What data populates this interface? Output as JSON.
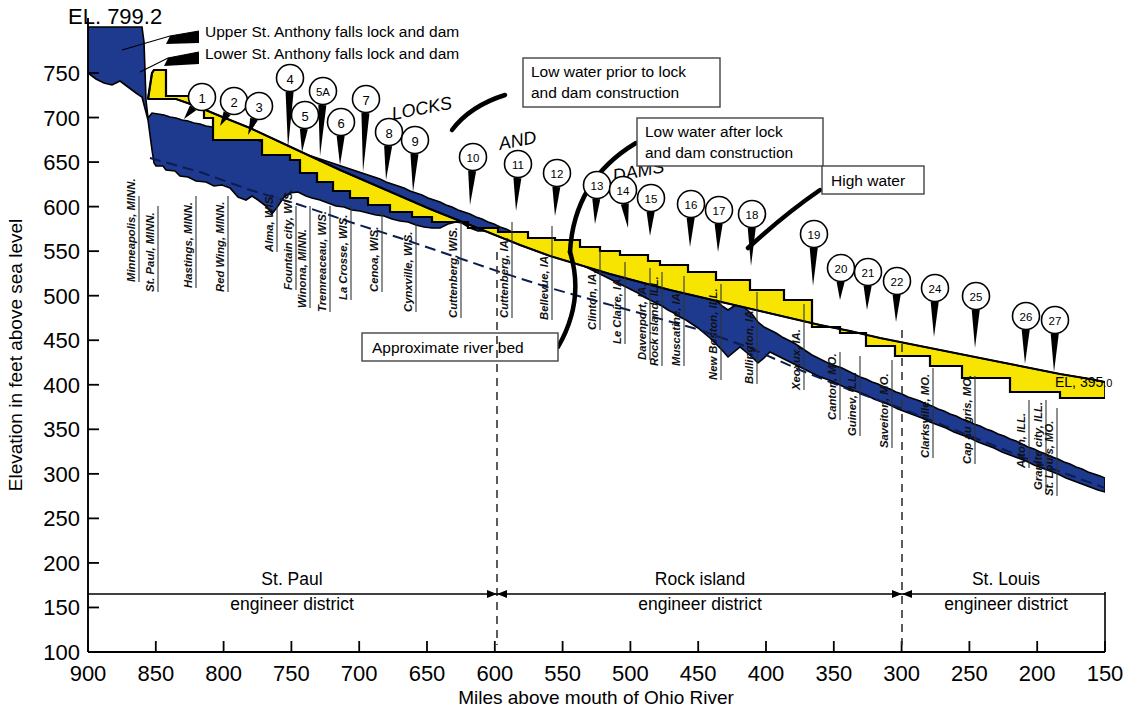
{
  "chart_data": {
    "type": "area",
    "xlabel": "Miles above mouth of Ohio River",
    "ylabel": "Elevation in feet above sea level",
    "xlim": [
      900,
      150
    ],
    "ylim": [
      100,
      780
    ],
    "x_ticks": [
      900,
      850,
      800,
      750,
      700,
      650,
      600,
      550,
      500,
      450,
      400,
      350,
      300,
      250,
      200,
      150
    ],
    "y_ticks": [
      100,
      150,
      200,
      250,
      300,
      350,
      400,
      450,
      500,
      550,
      600,
      650,
      700,
      750
    ],
    "grid": false,
    "legend_position": "annotations",
    "annotations": {
      "top_elevation": "EL. 799.2",
      "bottom_elevation_prefix": "EL,",
      "bottom_elevation_value": "395",
      "bottom_elevation_decimal": ".0"
    },
    "series": [
      {
        "name": "Low water prior to lock and dam construction",
        "note": "upper black boundary of yellow band"
      },
      {
        "name": "Low water after lock and dam construction",
        "note": "stepped pool profile, top of blue steps"
      },
      {
        "name": "High water",
        "note": "upper blue envelope"
      },
      {
        "name": "Approximate river bed",
        "note": "dashed line through blue band"
      }
    ],
    "pool_steps_miles_elev": [
      [
        900,
        799.2
      ],
      [
        858,
        750
      ],
      [
        854,
        725
      ],
      [
        847,
        725
      ],
      [
        840,
        700
      ],
      [
        820,
        700
      ],
      [
        810,
        686
      ],
      [
        775,
        686
      ],
      [
        770,
        675
      ],
      [
        745,
        675
      ],
      [
        735,
        667
      ],
      [
        712,
        667
      ],
      [
        705,
        660
      ],
      [
        690,
        660
      ],
      [
        683,
        651
      ],
      [
        660,
        651
      ],
      [
        652,
        645
      ],
      [
        630,
        645
      ],
      [
        622,
        639
      ],
      [
        603,
        639
      ],
      [
        596,
        620
      ],
      [
        566,
        620
      ],
      [
        558,
        611
      ],
      [
        535,
        611
      ],
      [
        528,
        603
      ],
      [
        505,
        603
      ],
      [
        498,
        596
      ],
      [
        470,
        596
      ],
      [
        462,
        584
      ],
      [
        435,
        584
      ],
      [
        428,
        572
      ],
      [
        400,
        572
      ],
      [
        392,
        560
      ],
      [
        365,
        560
      ],
      [
        357,
        540
      ],
      [
        345,
        528
      ],
      [
        330,
        519
      ],
      [
        310,
        502
      ],
      [
        290,
        490
      ],
      [
        265,
        470
      ],
      [
        240,
        450
      ],
      [
        215,
        430
      ],
      [
        195,
        418
      ],
      [
        175,
        400
      ],
      [
        150,
        395
      ]
    ]
  },
  "axes": {
    "x_title": "Miles above mouth of Ohio River",
    "y_title": "Elevation in feet above sea level",
    "x_labels": [
      "900",
      "850",
      "800",
      "750",
      "700",
      "650",
      "600",
      "550",
      "500",
      "450",
      "400",
      "350",
      "300",
      "250",
      "200",
      "150"
    ],
    "y_labels": [
      "750",
      "700",
      "650",
      "600",
      "550",
      "500",
      "450",
      "400",
      "350",
      "300",
      "250",
      "200",
      "150",
      "100"
    ]
  },
  "headline": {
    "top_elevation": "EL. 799.2",
    "right_elevation_main": "EL, 395",
    "right_elevation_tail": ".0"
  },
  "callouts": [
    {
      "id": "upper-st-anthony",
      "text": "Upper St. Anthony falls lock and dam"
    },
    {
      "id": "lower-st-anthony",
      "text": "Lower St. Anthony falls lock and dam"
    },
    {
      "id": "low-water-prior",
      "line1": "Low water prior to lock",
      "line2": "and dam construction"
    },
    {
      "id": "low-water-after",
      "line1": "Low water after lock",
      "line2": "and dam construction"
    },
    {
      "id": "high-water",
      "line1": "High water",
      "line2": ""
    },
    {
      "id": "approximate-river-bed",
      "line1": "Approximate river bed",
      "line2": ""
    }
  ],
  "locks_dams_heading": {
    "word1": "LOCKS",
    "word2": "AND",
    "word3": "DAMS"
  },
  "locks": [
    {
      "label": "1",
      "cx": 202,
      "cy": 97,
      "tx": 184,
      "ty": 119
    },
    {
      "label": "2",
      "cx": 234,
      "cy": 101,
      "tx": 220,
      "ty": 126
    },
    {
      "label": "3",
      "cx": 259,
      "cy": 106,
      "tx": 248,
      "ty": 135
    },
    {
      "label": "4",
      "cx": 290,
      "cy": 78,
      "tx": 288,
      "ty": 148
    },
    {
      "label": "5",
      "cx": 305,
      "cy": 115,
      "tx": 302,
      "ty": 152
    },
    {
      "label": "5A",
      "cx": 323,
      "cy": 91,
      "tx": 320,
      "ty": 156
    },
    {
      "label": "6",
      "cx": 341,
      "cy": 122,
      "tx": 340,
      "ty": 165
    },
    {
      "label": "7",
      "cx": 366,
      "cy": 99,
      "tx": 363,
      "ty": 172
    },
    {
      "label": "8",
      "cx": 389,
      "cy": 132,
      "tx": 386,
      "ty": 180
    },
    {
      "label": "9",
      "cx": 415,
      "cy": 140,
      "tx": 413,
      "ty": 192
    },
    {
      "label": "10",
      "cx": 473,
      "cy": 157,
      "tx": 470,
      "ty": 205
    },
    {
      "label": "11",
      "cx": 518,
      "cy": 164,
      "tx": 516,
      "ty": 211
    },
    {
      "label": "12",
      "cx": 557,
      "cy": 173,
      "tx": 555,
      "ty": 216
    },
    {
      "label": "13",
      "cx": 597,
      "cy": 185,
      "tx": 595,
      "ty": 224
    },
    {
      "label": "14",
      "cx": 623,
      "cy": 190,
      "tx": 628,
      "ty": 228
    },
    {
      "label": "15",
      "cx": 651,
      "cy": 198,
      "tx": 650,
      "ty": 236
    },
    {
      "label": "16",
      "cx": 691,
      "cy": 204,
      "tx": 690,
      "ty": 247
    },
    {
      "label": "17",
      "cx": 719,
      "cy": 210,
      "tx": 718,
      "ty": 252
    },
    {
      "label": "18",
      "cx": 752,
      "cy": 214,
      "tx": 751,
      "ty": 266
    },
    {
      "label": "19",
      "cx": 814,
      "cy": 234,
      "tx": 813,
      "ty": 286
    },
    {
      "label": "20",
      "cx": 841,
      "cy": 268,
      "tx": 840,
      "ty": 300
    },
    {
      "label": "21",
      "cx": 868,
      "cy": 272,
      "tx": 867,
      "ty": 310
    },
    {
      "label": "22",
      "cx": 897,
      "cy": 281,
      "tx": 896,
      "ty": 322
    },
    {
      "label": "24",
      "cx": 935,
      "cy": 288,
      "tx": 934,
      "ty": 337
    },
    {
      "label": "25",
      "cx": 976,
      "cy": 296,
      "tx": 975,
      "ty": 348
    },
    {
      "label": "26",
      "cx": 1026,
      "cy": 316,
      "tx": 1025,
      "ty": 364
    },
    {
      "label": "27",
      "cx": 1055,
      "cy": 320,
      "tx": 1054,
      "ty": 372
    }
  ],
  "cities": [
    {
      "name": "Minneapolis, MINN.",
      "x": 139,
      "top": 196,
      "bottom": 282
    },
    {
      "name": "St. Paul, MINN.",
      "x": 158,
      "top": 206,
      "bottom": 292
    },
    {
      "name": "Hastings, MINN.",
      "x": 196,
      "top": 196,
      "bottom": 288
    },
    {
      "name": "Red Wing, MINN.",
      "x": 228,
      "top": 196,
      "bottom": 292
    },
    {
      "name": "Alma, WIS.",
      "x": 277,
      "top": 196,
      "bottom": 252
    },
    {
      "name": "Fountain city, WIS.",
      "x": 296,
      "top": 206,
      "bottom": 290
    },
    {
      "name": "Winona, MINN.",
      "x": 310,
      "top": 206,
      "bottom": 308
    },
    {
      "name": "Tremreaceau, WIS.",
      "x": 330,
      "top": 206,
      "bottom": 312
    },
    {
      "name": "La Crosse, WIS.",
      "x": 351,
      "top": 206,
      "bottom": 300
    },
    {
      "name": "Cenoa, WIS.",
      "x": 382,
      "top": 210,
      "bottom": 292
    },
    {
      "name": "Cynxville, WIS.",
      "x": 416,
      "top": 222,
      "bottom": 312
    },
    {
      "name": "Cuttenberg, WIS.",
      "x": 461,
      "top": 222,
      "bottom": 318
    },
    {
      "name": "Cuttenberg, IA.",
      "x": 512,
      "top": 222,
      "bottom": 318
    },
    {
      "name": "Bellevue, IA.",
      "x": 552,
      "top": 226,
      "bottom": 320
    },
    {
      "name": "Clinton, IA.",
      "x": 600,
      "top": 250,
      "bottom": 330
    },
    {
      "name": "Le Claire, IA.",
      "x": 625,
      "top": 262,
      "bottom": 344
    },
    {
      "name": "Davenport, IA.",
      "x": 650,
      "top": 268,
      "bottom": 360
    },
    {
      "name": "Rock island, ILL.",
      "x": 662,
      "top": 272,
      "bottom": 366
    },
    {
      "name": "Muscatine, IA.",
      "x": 684,
      "top": 276,
      "bottom": 366
    },
    {
      "name": "New Boston, ILL.",
      "x": 721,
      "top": 284,
      "bottom": 380
    },
    {
      "name": "Bullington, IA.",
      "x": 757,
      "top": 292,
      "bottom": 384
    },
    {
      "name": "Xeoxux, IA.",
      "x": 804,
      "top": 304,
      "bottom": 390
    },
    {
      "name": "Canton, MO.",
      "x": 840,
      "top": 352,
      "bottom": 420
    },
    {
      "name": "Guinev, ILL.",
      "x": 860,
      "top": 356,
      "bottom": 436
    },
    {
      "name": "Saveiton, MO.",
      "x": 892,
      "top": 360,
      "bottom": 448
    },
    {
      "name": "Clarksville, MO.",
      "x": 933,
      "top": 368,
      "bottom": 458
    },
    {
      "name": "Cap au gris, MO.",
      "x": 975,
      "top": 376,
      "bottom": 464
    },
    {
      "name": "Alton, ILL.",
      "x": 1029,
      "top": 400,
      "bottom": 468
    },
    {
      "name": "Granite city, ILL.",
      "x": 1046,
      "top": 400,
      "bottom": 490
    },
    {
      "name": "St. Louis, MO.",
      "x": 1057,
      "top": 408,
      "bottom": 496
    }
  ],
  "districts": [
    {
      "name": "St. Paul",
      "sub": "engineer district",
      "x": 292,
      "left": 88,
      "right": 497
    },
    {
      "name": "Rock island",
      "sub": "engineer district",
      "x": 700,
      "left": 497,
      "right": 902
    },
    {
      "name": "St. Louis",
      "sub": "engineer district",
      "x": 1006,
      "left": 902,
      "right": 1105
    }
  ],
  "colors": {
    "pool_yellow": "#f7e400",
    "water_blue": "#1e3a8f",
    "outline": "#000000",
    "background": "#ffffff"
  }
}
